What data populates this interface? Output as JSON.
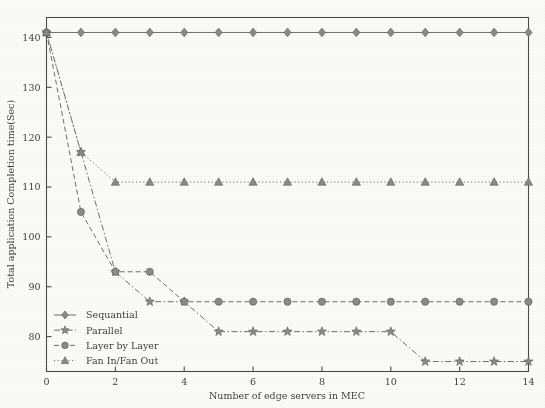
{
  "chart_data": {
    "type": "line",
    "title": "",
    "xlabel": "Number of edge servers in MEC",
    "ylabel": "Total application Completion time(Sec)",
    "xlim": [
      0,
      14
    ],
    "ylim": [
      73,
      144
    ],
    "xticks": [
      0,
      2,
      4,
      6,
      8,
      10,
      12,
      14
    ],
    "yticks": [
      80,
      90,
      100,
      110,
      120,
      130,
      140
    ],
    "grid": false,
    "legend_position": "lower left",
    "x": [
      0,
      1,
      2,
      3,
      4,
      5,
      6,
      7,
      8,
      9,
      10,
      11,
      12,
      13,
      14
    ],
    "series": [
      {
        "name": "Sequantial",
        "marker": "diamond",
        "linestyle": "solid",
        "values": [
          141,
          141,
          141,
          141,
          141,
          141,
          141,
          141,
          141,
          141,
          141,
          141,
          141,
          141,
          141
        ]
      },
      {
        "name": "Parallel",
        "marker": "star",
        "linestyle": "dashdot",
        "values": [
          141,
          117,
          93,
          87,
          87,
          81,
          81,
          81,
          81,
          81,
          81,
          75,
          75,
          75,
          75
        ]
      },
      {
        "name": "Layer by Layer",
        "marker": "circle",
        "linestyle": "dashed",
        "values": [
          141,
          105,
          93,
          93,
          87,
          87,
          87,
          87,
          87,
          87,
          87,
          87,
          87,
          87,
          87
        ]
      },
      {
        "name": "Fan In/Fan Out",
        "marker": "triangle",
        "linestyle": "dotted",
        "values": [
          141,
          117,
          111,
          111,
          111,
          111,
          111,
          111,
          111,
          111,
          111,
          111,
          111,
          111,
          111
        ]
      }
    ],
    "markers_at_x": [
      0,
      1,
      2,
      3,
      4,
      5,
      6,
      7,
      8,
      9,
      10,
      11,
      12,
      13,
      14
    ],
    "colors": {
      "line": "#6e6e6e",
      "marker_fill": "#8a8a8a",
      "axis": "#4b4b4b",
      "text": "#3f3f3f",
      "background": "#fbfbfa"
    }
  },
  "legend": {
    "items": [
      {
        "label": "Sequantial"
      },
      {
        "label": "Parallel"
      },
      {
        "label": "Layer by Layer"
      },
      {
        "label": "Fan In/Fan Out"
      }
    ]
  }
}
